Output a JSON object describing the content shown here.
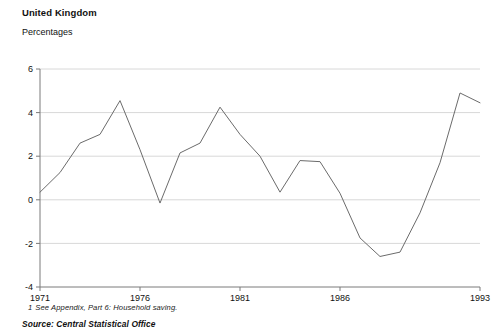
{
  "header": {
    "title": "United Kingdom",
    "subtitle": "Percentages"
  },
  "footnote": {
    "number": "1",
    "text": "See Appendix, Part 6: Household saving."
  },
  "source": {
    "text": "Source: Central Statistical Office"
  },
  "colors": {
    "line": "#6b6b6b",
    "grid": "#d8d8d8",
    "axis": "#7a7a7a",
    "text": "#111111",
    "background": "#ffffff"
  },
  "chart_data": {
    "type": "line",
    "title": "United Kingdom",
    "subtitle": "Percentages",
    "xlabel": "",
    "ylabel": "Percentages",
    "xlim": [
      1971,
      1993
    ],
    "ylim": [
      -4,
      6
    ],
    "yticks": [
      6,
      4,
      2,
      0,
      -2,
      -4
    ],
    "ytick_labels": [
      "6",
      "4",
      "2",
      "0",
      "-2",
      "-4"
    ],
    "xticks": [
      1971,
      1976,
      1981,
      1986,
      1993
    ],
    "xtick_labels": [
      "1971",
      "1976",
      "1981",
      "1986",
      "1993"
    ],
    "grid": "horizontal",
    "legend": "none",
    "series": [
      {
        "name": "Household saving ratio change",
        "x": [
          1971,
          1972,
          1973,
          1974,
          1975,
          1976,
          1977,
          1978,
          1979,
          1980,
          1981,
          1982,
          1983,
          1984,
          1985,
          1986,
          1987,
          1988,
          1989,
          1990,
          1991,
          1992,
          1993
        ],
        "values": [
          0.35,
          1.25,
          2.6,
          3.0,
          4.55,
          2.3,
          -0.15,
          2.15,
          2.6,
          4.25,
          3.0,
          2.0,
          0.35,
          1.8,
          1.75,
          0.3,
          -1.75,
          -2.6,
          -2.4,
          -0.6,
          1.7,
          4.9,
          4.45
        ]
      }
    ]
  }
}
